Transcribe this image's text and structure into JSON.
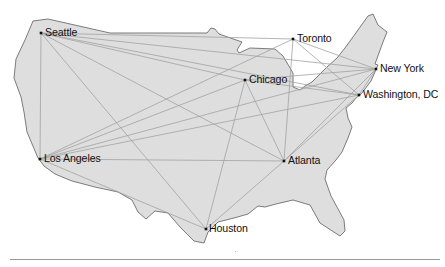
{
  "map": {
    "title": "",
    "colors": {
      "land_fill": "#dedede",
      "land_stroke": "#6e6e6e",
      "route": "#a2a2a2",
      "city_dot": "#111111",
      "label": "#111111"
    },
    "outline_points": "33,21 48,19 110,33 207,33 211,28 215,29 219,34 242,42 237,50 239,53 250,48 275,49 283,56 293,73 293,87 300,90 305,86 312,82 327,67 337,58 345,48 368,16 373,14 378,25 387,32 383,42 375,64 378,65 371,81 362,93 356,98 352,103 346,108 348,118 352,127 348,138 342,152 336,160 327,170 325,179 331,196 344,220 345,231 340,236 320,223 310,205 293,200 276,204 265,207 258,206 248,214 234,218 218,222 208,232 204,243 194,241 180,227 168,213 155,211 146,219 138,212 132,200 118,192 95,187 72,181 55,174 44,166 38,158 27,132 24,112 21,97 14,78 16,59 25,40"
  },
  "cities": [
    {
      "id": "seattle",
      "name": "Seattle",
      "x": 41,
      "y": 33
    },
    {
      "id": "toronto",
      "name": "Toronto",
      "x": 293,
      "y": 39
    },
    {
      "id": "new-york",
      "name": "New York",
      "x": 376,
      "y": 69
    },
    {
      "id": "chicago",
      "name": "Chicago",
      "x": 245,
      "y": 80
    },
    {
      "id": "washington-dc",
      "name": "Washington, DC",
      "x": 359,
      "y": 95
    },
    {
      "id": "los-angeles",
      "name": "Los Angeles",
      "x": 40,
      "y": 159
    },
    {
      "id": "atlanta",
      "name": "Atlanta",
      "x": 284,
      "y": 161
    },
    {
      "id": "houston",
      "name": "Houston",
      "x": 206,
      "y": 229
    }
  ],
  "routes": [
    [
      "seattle",
      "toronto"
    ],
    [
      "seattle",
      "new-york"
    ],
    [
      "seattle",
      "washington-dc"
    ],
    [
      "seattle",
      "chicago"
    ],
    [
      "seattle",
      "atlanta"
    ],
    [
      "seattle",
      "houston"
    ],
    [
      "seattle",
      "los-angeles"
    ],
    [
      "los-angeles",
      "toronto"
    ],
    [
      "los-angeles",
      "chicago"
    ],
    [
      "los-angeles",
      "new-york"
    ],
    [
      "los-angeles",
      "washington-dc"
    ],
    [
      "los-angeles",
      "atlanta"
    ],
    [
      "los-angeles",
      "houston"
    ],
    [
      "chicago",
      "houston"
    ],
    [
      "chicago",
      "atlanta"
    ],
    [
      "chicago",
      "new-york"
    ],
    [
      "chicago",
      "washington-dc"
    ],
    [
      "toronto",
      "atlanta"
    ],
    [
      "toronto",
      "new-york"
    ],
    [
      "toronto",
      "washington-dc"
    ],
    [
      "atlanta",
      "houston"
    ],
    [
      "atlanta",
      "new-york"
    ],
    [
      "atlanta",
      "washington-dc"
    ],
    [
      "new-york",
      "washington-dc"
    ]
  ],
  "labels": {
    "seattle": "Seattle",
    "toronto": "Toronto",
    "new_york": "New York",
    "chicago": "Chicago",
    "washington_dc": "Washington, DC",
    "los_angeles": "Los Angeles",
    "atlanta": "Atlanta",
    "houston": "Houston"
  }
}
